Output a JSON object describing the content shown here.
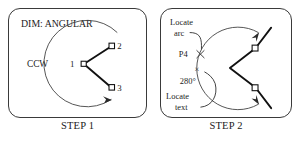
{
  "figure": {
    "title_hidden": "",
    "panels": [
      {
        "id": "step1",
        "caption": "STEP 1",
        "prompt_label": "DIM: ANGULAR",
        "direction_label": "CCW",
        "vertex_label": "1",
        "point_labels": [
          "2",
          "3"
        ],
        "icons": {
          "arc_arrow": "arrow-head-icon",
          "vertex_marker": "square-marker-icon",
          "point_marker": "square-marker-icon"
        }
      },
      {
        "id": "step2",
        "caption": "STEP 2",
        "locate_arc_label_line1": "Locate",
        "locate_arc_label_line2": "arc",
        "locate_text_label_line1": "Locate",
        "locate_text_label_line2": "text",
        "pick_point_label": "P4",
        "dimension_value": "280°",
        "cursor_glyph": "×",
        "icons": {
          "arc_arrow_top": "arrow-head-icon",
          "arc_arrow_bottom": "arrow-head-icon",
          "extension_marker_top": "square-marker-icon",
          "extension_marker_bottom": "square-marker-icon",
          "crosshair": "crosshair-icon"
        }
      }
    ],
    "colors": {
      "panel_border": "#3a3a3a",
      "thin_line": "#3f3f3f",
      "bold_line": "#111111",
      "text": "#1b1b1b",
      "background": "#ffffff"
    }
  }
}
